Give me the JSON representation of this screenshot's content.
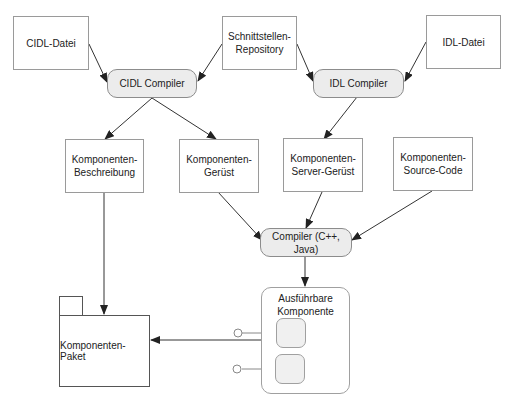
{
  "diagram": {
    "nodes": {
      "cidl_datei": {
        "label": "CIDL-Datei"
      },
      "schnittstellen_repo": {
        "label": "Schnittstellen-\nRepository"
      },
      "idl_datei": {
        "label": "IDL-Datei"
      },
      "cidl_compiler": {
        "label": "CIDL Compiler"
      },
      "idl_compiler": {
        "label": "IDL Compiler"
      },
      "komp_beschreibung": {
        "label": "Komponenten-\nBeschreibung"
      },
      "komp_geruest": {
        "label": "Komponenten-\nGerüst"
      },
      "komp_server_geruest": {
        "label": "Komponenten-\nServer-Gerüst"
      },
      "komp_source_code": {
        "label": "Komponenten-\nSource-Code"
      },
      "compiler_cpp_java": {
        "label": "Compiler (C++,\nJava)"
      },
      "ausfuehrbare_komponente": {
        "label": "Ausführbare\nKomponente"
      },
      "komp_paket": {
        "label": "Komponenten-Paket"
      }
    },
    "edges": [
      {
        "from": "CIDL-Datei",
        "to": "CIDL Compiler"
      },
      {
        "from": "Schnittstellen-Repository",
        "to": "CIDL Compiler"
      },
      {
        "from": "Schnittstellen-Repository",
        "to": "IDL Compiler"
      },
      {
        "from": "IDL-Datei",
        "to": "IDL Compiler"
      },
      {
        "from": "CIDL Compiler",
        "to": "Komponenten-Beschreibung"
      },
      {
        "from": "CIDL Compiler",
        "to": "Komponenten-Gerüst"
      },
      {
        "from": "IDL Compiler",
        "to": "Komponenten-Server-Gerüst"
      },
      {
        "from": "Komponenten-Gerüst",
        "to": "Compiler (C++, Java)"
      },
      {
        "from": "Komponenten-Server-Gerüst",
        "to": "Compiler (C++, Java)"
      },
      {
        "from": "Komponenten-Source-Code",
        "to": "Compiler (C++, Java)"
      },
      {
        "from": "Compiler (C++, Java)",
        "to": "Ausführbare Komponente"
      },
      {
        "from": "Komponenten-Beschreibung",
        "to": "Komponenten-Paket"
      },
      {
        "from": "Ausführbare Komponente",
        "to": "Komponenten-Paket"
      }
    ],
    "colors": {
      "process_fill": "#ececec",
      "box_border": "#9a9a9a",
      "edge": "#333333"
    }
  }
}
